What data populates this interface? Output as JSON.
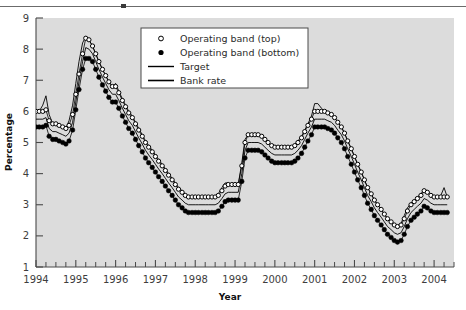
{
  "figure": {
    "top_rule": true,
    "plot_bg": "#dcdcdc",
    "axis_color": "#4a4a4a",
    "series_color": "#000000"
  },
  "axes": {
    "ylabel": "Percentage",
    "xlabel": "Year",
    "yticks": [
      "9",
      "8",
      "7",
      "6",
      "5",
      "4",
      "3",
      "2",
      "1"
    ],
    "xticks": [
      "1994",
      "1995",
      "1996",
      "1997",
      "1998",
      "1999",
      "2000",
      "2001",
      "2002",
      "2003",
      "2004"
    ],
    "ylim": [
      1,
      9
    ],
    "xlim": [
      1994.0,
      2004.5
    ],
    "minor_ticks_per_year": 4
  },
  "legend": {
    "position": "top-center",
    "items": [
      {
        "label": "Operating band (top)",
        "marker": "open-circle"
      },
      {
        "label": "Operating band (bottom)",
        "marker": "filled-circle"
      },
      {
        "label": "Target",
        "marker": "line"
      },
      {
        "label": "Bank rate",
        "marker": "line"
      }
    ]
  },
  "chart_data": {
    "type": "line",
    "title": "",
    "xlabel": "Year",
    "ylabel": "Percentage",
    "xlim": [
      1994.0,
      2004.5
    ],
    "ylim": [
      1,
      9
    ],
    "grid": false,
    "legend_position": "top-center",
    "x": [
      1994.0,
      1994.08,
      1994.17,
      1994.25,
      1994.33,
      1994.42,
      1994.5,
      1994.58,
      1994.67,
      1994.75,
      1994.83,
      1994.92,
      1995.0,
      1995.08,
      1995.17,
      1995.25,
      1995.33,
      1995.42,
      1995.5,
      1995.58,
      1995.67,
      1995.75,
      1995.83,
      1995.92,
      1996.0,
      1996.08,
      1996.17,
      1996.25,
      1996.33,
      1996.42,
      1996.5,
      1996.58,
      1996.67,
      1996.75,
      1996.83,
      1996.92,
      1997.0,
      1997.08,
      1997.17,
      1997.25,
      1997.33,
      1997.42,
      1997.5,
      1997.58,
      1997.67,
      1997.75,
      1997.83,
      1997.92,
      1998.0,
      1998.08,
      1998.17,
      1998.25,
      1998.33,
      1998.42,
      1998.5,
      1998.58,
      1998.67,
      1998.75,
      1998.83,
      1998.92,
      1999.0,
      1999.08,
      1999.17,
      1999.25,
      1999.33,
      1999.42,
      1999.5,
      1999.58,
      1999.67,
      1999.75,
      1999.83,
      1999.92,
      2000.0,
      2000.08,
      2000.17,
      2000.25,
      2000.33,
      2000.42,
      2000.5,
      2000.58,
      2000.67,
      2000.75,
      2000.83,
      2000.92,
      2001.0,
      2001.08,
      2001.17,
      2001.25,
      2001.33,
      2001.42,
      2001.5,
      2001.58,
      2001.67,
      2001.75,
      2001.83,
      2001.92,
      2002.0,
      2002.08,
      2002.17,
      2002.25,
      2002.33,
      2002.42,
      2002.5,
      2002.58,
      2002.67,
      2002.75,
      2002.83,
      2002.92,
      2003.0,
      2003.08,
      2003.17,
      2003.25,
      2003.33,
      2003.42,
      2003.5,
      2003.58,
      2003.67,
      2003.75,
      2003.83,
      2003.92,
      2004.0,
      2004.08,
      2004.17,
      2004.25,
      2004.33
    ],
    "series": [
      {
        "name": "Operating band (top)",
        "marker": "open-circle",
        "values": [
          6.0,
          6.0,
          6.0,
          6.05,
          5.7,
          5.6,
          5.6,
          5.55,
          5.5,
          5.45,
          5.55,
          5.9,
          6.55,
          7.2,
          7.85,
          8.35,
          8.3,
          8.1,
          7.85,
          7.6,
          7.35,
          7.15,
          6.95,
          6.8,
          6.8,
          6.6,
          6.35,
          6.15,
          5.95,
          5.8,
          5.6,
          5.4,
          5.2,
          5.0,
          4.85,
          4.7,
          4.55,
          4.4,
          4.25,
          4.1,
          3.95,
          3.8,
          3.65,
          3.5,
          3.4,
          3.3,
          3.25,
          3.25,
          3.25,
          3.25,
          3.25,
          3.25,
          3.25,
          3.25,
          3.25,
          3.3,
          3.45,
          3.6,
          3.65,
          3.65,
          3.65,
          3.65,
          4.25,
          5.0,
          5.25,
          5.25,
          5.25,
          5.25,
          5.2,
          5.1,
          5.0,
          4.9,
          4.85,
          4.85,
          4.85,
          4.85,
          4.85,
          4.85,
          4.9,
          5.0,
          5.15,
          5.35,
          5.55,
          5.75,
          6.0,
          6.0,
          6.0,
          6.0,
          5.95,
          5.9,
          5.8,
          5.65,
          5.5,
          5.3,
          5.05,
          4.8,
          4.55,
          4.3,
          4.05,
          3.8,
          3.55,
          3.35,
          3.15,
          3.0,
          2.85,
          2.7,
          2.55,
          2.45,
          2.35,
          2.3,
          2.35,
          2.55,
          2.8,
          3.0,
          3.1,
          3.2,
          3.3,
          3.45,
          3.4,
          3.3,
          3.25,
          3.25,
          3.25,
          3.25,
          3.25
        ]
      },
      {
        "name": "Operating band (bottom)",
        "marker": "filled-circle",
        "values": [
          5.5,
          5.5,
          5.5,
          5.55,
          5.2,
          5.1,
          5.1,
          5.05,
          5.0,
          4.95,
          5.05,
          5.4,
          6.05,
          6.7,
          7.35,
          7.7,
          7.7,
          7.6,
          7.35,
          7.1,
          6.85,
          6.65,
          6.45,
          6.3,
          6.3,
          6.1,
          5.85,
          5.65,
          5.45,
          5.3,
          5.1,
          4.9,
          4.7,
          4.5,
          4.35,
          4.2,
          4.05,
          3.9,
          3.75,
          3.6,
          3.45,
          3.3,
          3.15,
          3.0,
          2.9,
          2.8,
          2.75,
          2.75,
          2.75,
          2.75,
          2.75,
          2.75,
          2.75,
          2.75,
          2.75,
          2.8,
          2.95,
          3.1,
          3.15,
          3.15,
          3.15,
          3.15,
          3.75,
          4.5,
          4.75,
          4.75,
          4.75,
          4.75,
          4.7,
          4.6,
          4.5,
          4.4,
          4.35,
          4.35,
          4.35,
          4.35,
          4.35,
          4.35,
          4.4,
          4.5,
          4.65,
          4.85,
          5.05,
          5.25,
          5.5,
          5.5,
          5.5,
          5.5,
          5.45,
          5.4,
          5.3,
          5.15,
          5.0,
          4.8,
          4.55,
          4.3,
          4.05,
          3.8,
          3.55,
          3.3,
          3.05,
          2.85,
          2.65,
          2.5,
          2.35,
          2.2,
          2.05,
          1.95,
          1.85,
          1.8,
          1.85,
          2.05,
          2.3,
          2.5,
          2.6,
          2.7,
          2.8,
          2.95,
          2.9,
          2.8,
          2.75,
          2.75,
          2.75,
          2.75,
          2.75
        ]
      },
      {
        "name": "Target",
        "marker": "line",
        "values": [
          5.75,
          5.75,
          5.75,
          5.8,
          5.45,
          5.35,
          5.35,
          5.3,
          5.25,
          5.2,
          5.3,
          5.65,
          6.3,
          6.95,
          7.6,
          8.05,
          8.0,
          7.85,
          7.6,
          7.35,
          7.1,
          6.9,
          6.7,
          6.55,
          6.55,
          6.35,
          6.1,
          5.9,
          5.7,
          5.55,
          5.35,
          5.15,
          4.95,
          4.75,
          4.6,
          4.45,
          4.3,
          4.15,
          4.0,
          3.85,
          3.7,
          3.55,
          3.4,
          3.25,
          3.15,
          3.05,
          3.0,
          3.0,
          3.0,
          3.0,
          3.0,
          3.0,
          3.0,
          3.0,
          3.0,
          3.05,
          3.2,
          3.35,
          3.4,
          3.4,
          3.4,
          3.4,
          4.0,
          4.75,
          5.0,
          5.0,
          5.0,
          5.0,
          4.95,
          4.85,
          4.75,
          4.65,
          4.6,
          4.6,
          4.6,
          4.6,
          4.6,
          4.6,
          4.65,
          4.75,
          4.9,
          5.1,
          5.3,
          5.5,
          5.75,
          5.75,
          5.75,
          5.75,
          5.7,
          5.65,
          5.55,
          5.4,
          5.25,
          5.05,
          4.8,
          4.55,
          4.3,
          4.05,
          3.8,
          3.55,
          3.3,
          3.1,
          2.9,
          2.75,
          2.6,
          2.45,
          2.3,
          2.2,
          2.1,
          2.05,
          2.1,
          2.3,
          2.55,
          2.75,
          2.85,
          2.95,
          3.05,
          3.2,
          3.15,
          3.05,
          3.0,
          3.0,
          3.0,
          3.0,
          3.0
        ]
      },
      {
        "name": "Bank rate",
        "marker": "line",
        "values": [
          6.0,
          6.0,
          6.2,
          6.5,
          5.9,
          5.6,
          5.6,
          5.55,
          5.5,
          5.45,
          5.7,
          6.2,
          6.9,
          7.6,
          8.2,
          8.4,
          8.3,
          8.1,
          7.85,
          7.6,
          7.35,
          7.15,
          6.95,
          6.8,
          6.9,
          6.65,
          6.4,
          6.2,
          6.0,
          5.85,
          5.65,
          5.45,
          5.25,
          5.05,
          4.9,
          4.75,
          4.6,
          4.45,
          4.3,
          4.15,
          4.0,
          3.85,
          3.7,
          3.55,
          3.45,
          3.35,
          3.25,
          3.25,
          3.25,
          3.25,
          3.25,
          3.25,
          3.25,
          3.25,
          3.25,
          3.35,
          3.55,
          3.7,
          3.7,
          3.65,
          3.65,
          3.65,
          4.35,
          5.1,
          5.25,
          5.25,
          5.25,
          5.25,
          5.2,
          5.1,
          5.0,
          4.9,
          4.85,
          4.85,
          4.85,
          4.85,
          4.85,
          4.85,
          4.95,
          5.05,
          5.2,
          5.4,
          5.6,
          5.85,
          6.25,
          6.25,
          6.1,
          6.0,
          5.95,
          5.9,
          5.8,
          5.65,
          5.5,
          5.3,
          5.05,
          4.8,
          4.55,
          4.3,
          4.05,
          3.8,
          3.55,
          3.35,
          3.15,
          3.0,
          2.85,
          2.7,
          2.55,
          2.45,
          2.35,
          2.3,
          2.4,
          2.65,
          2.9,
          3.05,
          3.15,
          3.25,
          3.35,
          3.5,
          3.45,
          3.35,
          3.25,
          3.25,
          3.3,
          3.55,
          3.25
        ]
      }
    ]
  }
}
